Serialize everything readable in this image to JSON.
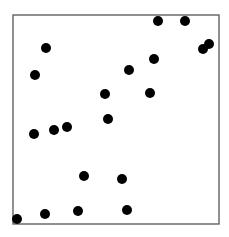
{
  "chart_data": {
    "type": "scatter",
    "title": "",
    "xlabel": "",
    "ylabel": "",
    "grid": false,
    "legend": null,
    "xlim": [
      0,
      206
    ],
    "ylim": [
      0,
      209
    ],
    "marker": {
      "color": "#000000",
      "radius": 5
    },
    "frame": {
      "color": "#555555"
    },
    "points": [
      {
        "x": 145,
        "y": 203
      },
      {
        "x": 172,
        "y": 203
      },
      {
        "x": 190,
        "y": 175
      },
      {
        "x": 196,
        "y": 180
      },
      {
        "x": 33,
        "y": 176
      },
      {
        "x": 22,
        "y": 149
      },
      {
        "x": 141,
        "y": 165
      },
      {
        "x": 116,
        "y": 154
      },
      {
        "x": 92,
        "y": 130
      },
      {
        "x": 137,
        "y": 131
      },
      {
        "x": 95,
        "y": 105
      },
      {
        "x": 21,
        "y": 90
      },
      {
        "x": 41,
        "y": 94
      },
      {
        "x": 54,
        "y": 97
      },
      {
        "x": 71,
        "y": 48
      },
      {
        "x": 109,
        "y": 45
      },
      {
        "x": 4,
        "y": 5
      },
      {
        "x": 32,
        "y": 10
      },
      {
        "x": 65,
        "y": 13
      },
      {
        "x": 114,
        "y": 14
      }
    ]
  },
  "layout": {
    "frame_left": 13,
    "frame_top": 15,
    "frame_width": 206,
    "frame_height": 209
  }
}
